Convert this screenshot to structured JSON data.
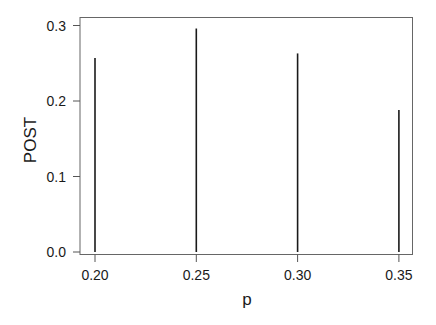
{
  "chart_data": {
    "type": "bar",
    "style": "spike",
    "title": "",
    "xlabel": "p",
    "ylabel": "POST",
    "x": [
      0.2,
      0.25,
      0.3,
      0.35
    ],
    "categories": [
      "0.20",
      "0.25",
      "0.30",
      "0.35"
    ],
    "values": [
      0.257,
      0.296,
      0.263,
      0.188
    ],
    "xticks": [
      "0.20",
      "0.25",
      "0.30",
      "0.35"
    ],
    "yticks": [
      "0.0",
      "0.1",
      "0.2",
      "0.3"
    ],
    "xlim": [
      0.192,
      0.353
    ],
    "ylim": [
      0.0,
      0.31
    ],
    "grid": false,
    "legend": null
  },
  "colors": {
    "line": "#1a1a1a",
    "axis": "#555555",
    "background": "#ffffff"
  }
}
